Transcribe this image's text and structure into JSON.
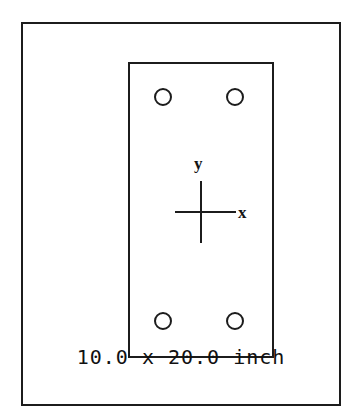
{
  "drawing": {
    "title": "Cross Section Drawing",
    "frame": {
      "name": "outer-frame",
      "border_color": "#1c1c1c"
    },
    "section": {
      "name": "rectangular-section",
      "width_value": "10.0",
      "height_value": "20.0",
      "units": "inch",
      "border_color": "#1c1c1c"
    },
    "axes": {
      "x_label": "x",
      "y_label": "y",
      "origin_label": "",
      "line_color": "#1c1c1c"
    },
    "holes": [
      {
        "id": "hole-top-left",
        "position": "top-left"
      },
      {
        "id": "hole-top-right",
        "position": "top-right"
      },
      {
        "id": "hole-bottom-left",
        "position": "bottom-left"
      },
      {
        "id": "hole-bottom-right",
        "position": "bottom-right"
      }
    ],
    "caption": "10.0 x 20.0 inch"
  }
}
